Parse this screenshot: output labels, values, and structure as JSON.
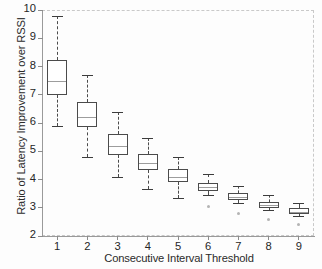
{
  "chart_data": {
    "type": "box",
    "title": "",
    "xlabel": "Consecutive Interval Threshold",
    "ylabel": "Ratio of Latency Improvement over RSSI",
    "xlim": [
      0.5,
      9.5
    ],
    "ylim": [
      2,
      10
    ],
    "grid": false,
    "legend": null,
    "categories": [
      "1",
      "2",
      "3",
      "4",
      "5",
      "6",
      "7",
      "8",
      "9"
    ],
    "ytick_labels": [
      "10",
      "9",
      "8",
      "7",
      "6",
      "5",
      "4",
      "3",
      "2"
    ],
    "ytick_values": [
      10,
      9,
      8,
      7,
      6,
      5,
      4,
      3,
      2
    ],
    "boxes": [
      {
        "category": "1",
        "whisker_low": 5.9,
        "q1": 7.0,
        "median": 7.48,
        "q3": 8.22,
        "whisker_high": 9.8,
        "outliers": []
      },
      {
        "category": "2",
        "whisker_low": 4.8,
        "q1": 5.85,
        "median": 6.22,
        "q3": 6.75,
        "whisker_high": 7.7,
        "outliers": []
      },
      {
        "category": "3",
        "whisker_low": 4.1,
        "q1": 4.85,
        "median": 5.18,
        "q3": 5.62,
        "whisker_high": 6.4,
        "outliers": []
      },
      {
        "category": "4",
        "whisker_low": 3.68,
        "q1": 4.35,
        "median": 4.58,
        "q3": 4.92,
        "whisker_high": 5.48,
        "outliers": []
      },
      {
        "category": "5",
        "whisker_low": 3.35,
        "q1": 3.92,
        "median": 4.1,
        "q3": 4.36,
        "whisker_high": 4.8,
        "outliers": []
      },
      {
        "category": "6",
        "whisker_low": 3.45,
        "q1": 3.58,
        "median": 3.72,
        "q3": 3.88,
        "whisker_high": 4.2,
        "outliers": [
          3.05
        ]
      },
      {
        "category": "7",
        "whisker_low": 3.18,
        "q1": 3.28,
        "median": 3.38,
        "q3": 3.52,
        "whisker_high": 3.78,
        "outliers": [
          2.78
        ]
      },
      {
        "category": "8",
        "whisker_low": 2.92,
        "q1": 3.0,
        "median": 3.1,
        "q3": 3.22,
        "whisker_high": 3.45,
        "outliers": [
          2.58
        ]
      },
      {
        "category": "9",
        "whisker_low": 2.7,
        "q1": 2.78,
        "median": 2.86,
        "q3": 2.98,
        "whisker_high": 3.18,
        "outliers": [
          2.4
        ]
      }
    ],
    "colors": {
      "box_edge": "#4b4b4b",
      "median": "#9d9d9d",
      "whisker": "#4b4b4b",
      "outlier": "#b4b4b4",
      "axis": "#9a9a9a",
      "frame": "#c9c9c9",
      "text": "#262626",
      "background": "#fdfdfd"
    }
  }
}
